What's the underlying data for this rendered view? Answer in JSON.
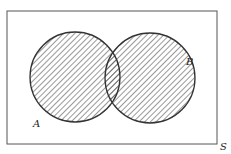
{
  "diagram": {
    "type": "venn",
    "universe_label": "S",
    "sets": [
      {
        "label": "A",
        "cx": 75,
        "cy": 77,
        "r": 45
      },
      {
        "label": "B",
        "cx": 150,
        "cy": 78,
        "r": 45
      }
    ],
    "shaded_region": "A ∪ B",
    "colors": {
      "stroke": "#333333",
      "hatch": "#444444",
      "background": "#ffffff"
    }
  }
}
